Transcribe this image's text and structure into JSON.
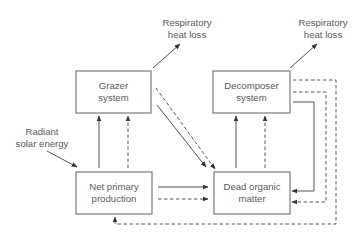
{
  "diagram": {
    "colors": {
      "stroke": "#555555",
      "box_stroke": "#6e6e6e",
      "text": "#5a5a5a",
      "background": "#ffffff"
    },
    "legend_note": "Solid arrows and dashed arrows represent two parallel flow types",
    "nodes": {
      "grazer": {
        "line1": "Grazer",
        "line2": "system"
      },
      "decomposer": {
        "line1": "Decomposer",
        "line2": "system"
      },
      "npp": {
        "line1": "Net primary",
        "line2": "production"
      },
      "dom": {
        "line1": "Dead organic",
        "line2": "matter"
      }
    },
    "labels": {
      "resp_left": {
        "line1": "Respiratory",
        "line2": "heat loss"
      },
      "resp_right": {
        "line1": "Respiratory",
        "line2": "heat loss"
      },
      "solar": {
        "line1": "Radiant",
        "line2": "solar energy"
      }
    },
    "edges": [
      {
        "from": "Radiant solar energy",
        "to": "Net primary production",
        "style": "solid"
      },
      {
        "from": "Net primary production",
        "to": "Grazer system",
        "style": "solid"
      },
      {
        "from": "Net primary production",
        "to": "Grazer system",
        "style": "dashed"
      },
      {
        "from": "Net primary production",
        "to": "Dead organic matter",
        "style": "solid"
      },
      {
        "from": "Net primary production",
        "to": "Dead organic matter",
        "style": "dashed"
      },
      {
        "from": "Grazer system",
        "to": "Respiratory heat loss",
        "style": "solid"
      },
      {
        "from": "Grazer system",
        "to": "Dead organic matter",
        "style": "solid"
      },
      {
        "from": "Grazer system",
        "to": "Dead organic matter",
        "style": "dashed"
      },
      {
        "from": "Dead organic matter",
        "to": "Decomposer system",
        "style": "solid"
      },
      {
        "from": "Dead organic matter",
        "to": "Decomposer system",
        "style": "dashed"
      },
      {
        "from": "Decomposer system",
        "to": "Respiratory heat loss",
        "style": "solid"
      },
      {
        "from": "Decomposer system",
        "to": "Dead organic matter",
        "style": "solid"
      },
      {
        "from": "Decomposer system",
        "to": "Dead organic matter",
        "style": "dashed"
      },
      {
        "from": "Decomposer system",
        "to": "Net primary production",
        "style": "dashed"
      }
    ]
  }
}
